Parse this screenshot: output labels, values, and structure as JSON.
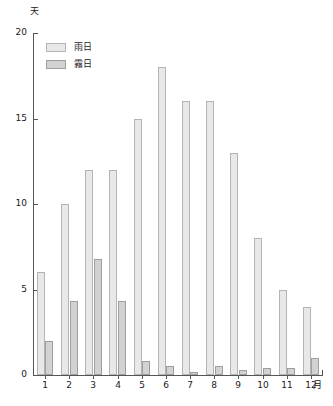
{
  "chart_data": {
    "type": "bar",
    "title": "",
    "xlabel": "月",
    "ylabel": "天",
    "ylim": [
      0,
      20
    ],
    "yticks": [
      0,
      5,
      10,
      15,
      20
    ],
    "grid": false,
    "legend_position": "top-left",
    "categories": [
      "1",
      "2",
      "3",
      "4",
      "5",
      "6",
      "7",
      "8",
      "9",
      "10",
      "11",
      "12"
    ],
    "series": [
      {
        "name": "雨日",
        "values": [
          6,
          10,
          12,
          12,
          15,
          18,
          16,
          16,
          13,
          8,
          5,
          4
        ]
      },
      {
        "name": "霧日",
        "values": [
          2,
          4.3,
          6.8,
          4.3,
          0.8,
          0.5,
          0.2,
          0.5,
          0.3,
          0.4,
          0.4,
          1
        ]
      }
    ]
  },
  "axes": {
    "y_unit_label": "天",
    "x_unit_label": "月",
    "y_tick_labels": [
      "20",
      "15",
      "10",
      "5",
      "0"
    ],
    "x_tick_labels": [
      "1",
      "2",
      "3",
      "4",
      "5",
      "6",
      "7",
      "8",
      "9",
      "10",
      "11",
      "12"
    ]
  },
  "legend": {
    "items": [
      {
        "label": "雨日",
        "color": "#e8e8e8"
      },
      {
        "label": "霧日",
        "color": "#d2d2d2"
      }
    ]
  },
  "colors": {
    "rain_fill": "#e8e8e8",
    "rain_stroke": "#b4b4b4",
    "fog_fill": "#d2d2d2",
    "fog_stroke": "#9e9e9e",
    "axis": "#555555",
    "text": "#1a1a1a",
    "background": "#ffffff"
  }
}
